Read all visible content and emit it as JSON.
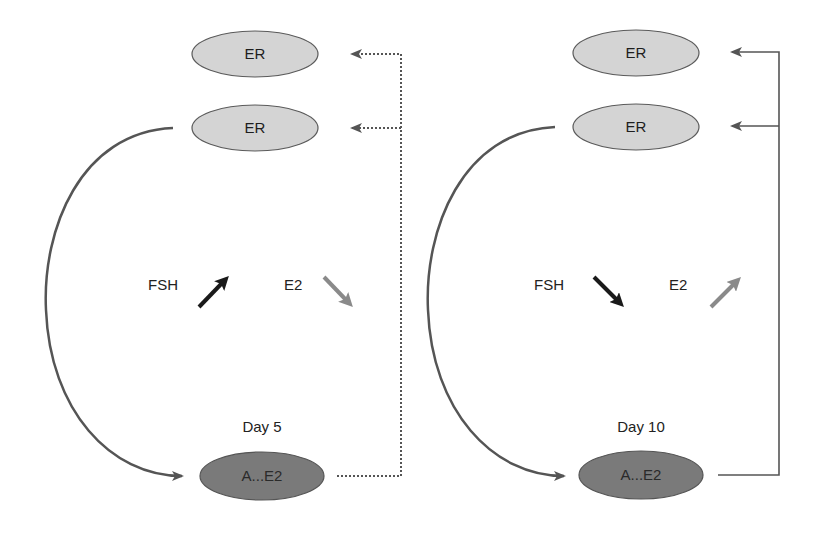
{
  "colors": {
    "er_fill": "#d4d4d4",
    "er_stroke": "#5a5a5a",
    "ae2_fill": "#7a7a7a",
    "ae2_stroke": "#555555",
    "curve": "#555555",
    "connector": "#555555",
    "fsh_arrow": "#1a1a1a",
    "e2_arrow": "#8a8a8a",
    "text": "#222222"
  },
  "panels": [
    {
      "id": "day5",
      "day_label": "Day 5",
      "er_nodes": [
        {
          "label": "ER"
        },
        {
          "label": "ER"
        }
      ],
      "source_node": {
        "label": "A...E2"
      },
      "fsh": {
        "label": "FSH",
        "direction": "up"
      },
      "e2": {
        "label": "E2",
        "direction": "down"
      },
      "feedback_line_style": "dotted"
    },
    {
      "id": "day10",
      "day_label": "Day 10",
      "er_nodes": [
        {
          "label": "ER"
        },
        {
          "label": "ER"
        }
      ],
      "source_node": {
        "label": "A...E2"
      },
      "fsh": {
        "label": "FSH",
        "direction": "down"
      },
      "e2": {
        "label": "E2",
        "direction": "up"
      },
      "feedback_line_style": "solid"
    }
  ]
}
